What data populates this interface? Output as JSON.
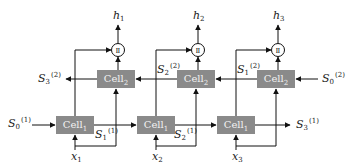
{
  "diagram": {
    "bottom_cells": [
      {
        "name": "Cell",
        "sub": "1"
      },
      {
        "name": "Cell",
        "sub": "1"
      },
      {
        "name": "Cell",
        "sub": "1"
      }
    ],
    "top_cells": [
      {
        "name": "Cell",
        "sub": "2"
      },
      {
        "name": "Cell",
        "sub": "2"
      },
      {
        "name": "Cell",
        "sub": "2"
      }
    ],
    "outputs": [
      {
        "var": "h",
        "sub": "1"
      },
      {
        "var": "h",
        "sub": "2"
      },
      {
        "var": "h",
        "sub": "3"
      }
    ],
    "inputs": [
      {
        "var": "x",
        "sub": "1"
      },
      {
        "var": "x",
        "sub": "2"
      },
      {
        "var": "x",
        "sub": "3"
      }
    ],
    "forward_states": [
      {
        "var": "S",
        "sub": "0",
        "sup": "(1)"
      },
      {
        "var": "S",
        "sub": "1",
        "sup": "(1)"
      },
      {
        "var": "S",
        "sub": "2",
        "sup": "(1)"
      },
      {
        "var": "S",
        "sub": "3",
        "sup": "(1)"
      }
    ],
    "backward_states": [
      {
        "var": "S",
        "sub": "3",
        "sup": "(2)"
      },
      {
        "var": "S",
        "sub": "2",
        "sup": "(2)"
      },
      {
        "var": "S",
        "sub": "1",
        "sup": "(2)"
      },
      {
        "var": "S",
        "sub": "0",
        "sup": "(2)"
      }
    ],
    "concat_symbol": "Ⅱ",
    "colors": {
      "cell_fill": "#8a8a8a",
      "cell_text": "#f2f2f2",
      "line": "#111111"
    }
  }
}
